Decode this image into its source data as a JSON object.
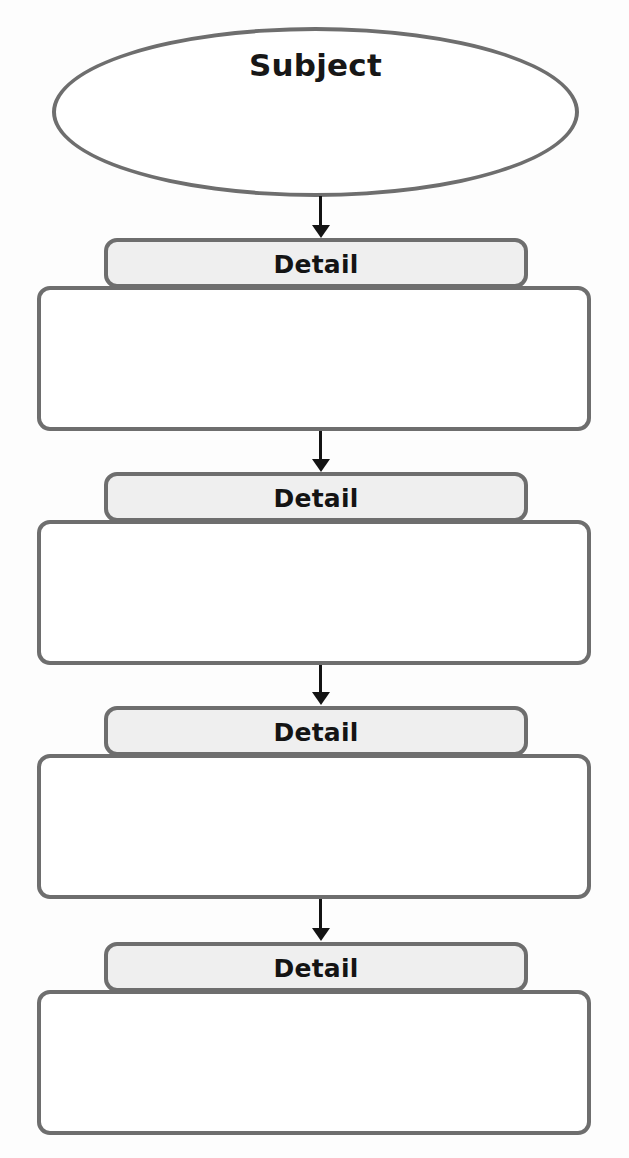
{
  "diagram": {
    "type": "flowchart-vertical",
    "colors": {
      "page_background": "#fdfdfd",
      "shape_outline": "#6e6e6e",
      "header_fill": "#efefef",
      "body_fill": "#ffffff",
      "arrow": "#131313",
      "text": "#141414"
    },
    "subject": {
      "shape": "ellipse",
      "label": "Subject"
    },
    "details": [
      {
        "header_label": "Detail",
        "body_text": ""
      },
      {
        "header_label": "Detail",
        "body_text": ""
      },
      {
        "header_label": "Detail",
        "body_text": ""
      },
      {
        "header_label": "Detail",
        "body_text": ""
      }
    ],
    "connectors": [
      {
        "from": "Subject",
        "to": "Detail 1",
        "icon": "arrow-down-icon"
      },
      {
        "from": "Detail 1",
        "to": "Detail 2",
        "icon": "arrow-down-icon"
      },
      {
        "from": "Detail 2",
        "to": "Detail 3",
        "icon": "arrow-down-icon"
      },
      {
        "from": "Detail 3",
        "to": "Detail 4",
        "icon": "arrow-down-icon"
      }
    ]
  }
}
